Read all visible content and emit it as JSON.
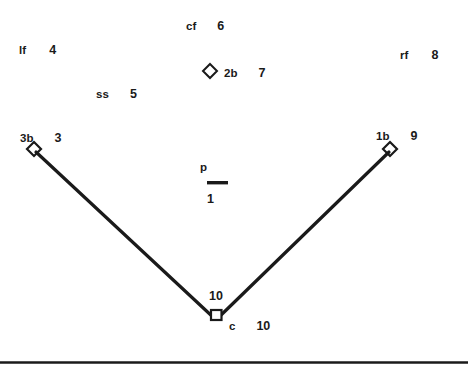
{
  "diagram": {
    "background_color": "#ffffff",
    "ink_color": "#1a1a1a",
    "positions": [
      {
        "key": "cf",
        "abbr": "cf",
        "number": "6",
        "name": "center-field"
      },
      {
        "key": "lf",
        "abbr": "lf",
        "number": "4",
        "name": "left-field"
      },
      {
        "key": "rf",
        "abbr": "rf",
        "number": "8",
        "name": "right-field"
      },
      {
        "key": "2b",
        "abbr": "2b",
        "number": "7",
        "name": "second-base"
      },
      {
        "key": "ss",
        "abbr": "ss",
        "number": "5",
        "name": "shortstop"
      },
      {
        "key": "3b",
        "abbr": "3b",
        "number": "3",
        "name": "third-base"
      },
      {
        "key": "1b",
        "abbr": "1b",
        "number": "9",
        "name": "first-base"
      },
      {
        "key": "p",
        "abbr": "p",
        "number": "1",
        "name": "pitcher"
      },
      {
        "key": "c",
        "abbr": "c",
        "number": "10",
        "name": "catcher"
      }
    ],
    "bases": {
      "second_base": "base-diamond",
      "third_base": "base-diamond",
      "first_base": "base-diamond",
      "home_plate": "home-plate-square",
      "pitchers_rubber": "pitchers-rubber"
    },
    "foul_lines": {
      "left_line": "third-base-foul-line",
      "right_line": "first-base-foul-line"
    },
    "bottom_rule": "horizontal-divider"
  }
}
